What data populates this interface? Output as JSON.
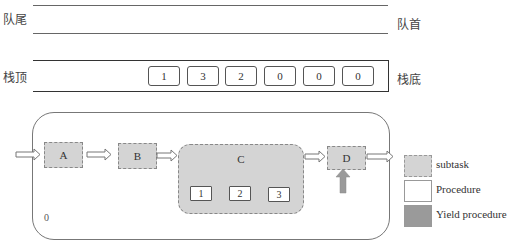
{
  "queue": {
    "tail_label": "队尾",
    "head_label": "队首"
  },
  "stack": {
    "top_label": "栈顶",
    "bottom_label": "栈底",
    "cells": [
      "1",
      "3",
      "2",
      "0",
      "0",
      "0"
    ]
  },
  "flow": {
    "container_label": "0",
    "tasks": {
      "a": "A",
      "b": "B",
      "c": "C",
      "d": "D"
    },
    "c_procedures": [
      "1",
      "2",
      "3"
    ]
  },
  "legend": {
    "items": [
      {
        "label": "subtask",
        "color": "#d4d4d4"
      },
      {
        "label": "Procedure",
        "color": "#ffffff"
      },
      {
        "label": "Yield procedure",
        "color": "#9a9a9a"
      }
    ]
  },
  "colors": {
    "subtask_fill": "#d4d4d4",
    "yield_arrow": "#9a9a9a",
    "line": "#666666"
  }
}
